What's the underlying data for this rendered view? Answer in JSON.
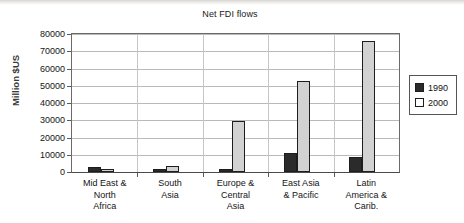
{
  "chart_data": {
    "type": "bar",
    "title": "Net FDI flows",
    "xlabel": "",
    "ylabel": "Million $US",
    "ylim": [
      0,
      80000
    ],
    "ytick_step": 10000,
    "yticks": [
      "0",
      "10000",
      "20000",
      "30000",
      "40000",
      "50000",
      "60000",
      "70000",
      "80000"
    ],
    "grid": true,
    "legend_position": "right",
    "categories": [
      "Mid East & North Africa",
      "South Asia",
      "Europe & Central Asia",
      "East Asia & Pacific",
      "Latin America & Carib."
    ],
    "category_label_lines": [
      [
        "Mid East &",
        "North",
        "Africa"
      ],
      [
        "South",
        "Asia"
      ],
      [
        "Europe &",
        "Central",
        "Asia"
      ],
      [
        "East Asia",
        "& Pacific"
      ],
      [
        "Latin",
        "America &",
        "Carib."
      ]
    ],
    "series": [
      {
        "name": "1990",
        "color": "#2b2b2b",
        "values": [
          2700,
          400,
          1200,
          11000,
          8700
        ]
      },
      {
        "name": "2000",
        "color": "#d2d2d2",
        "values": [
          1100,
          3200,
          29500,
          52800,
          76200
        ]
      }
    ]
  },
  "legend": {
    "items": [
      {
        "label": "1990"
      },
      {
        "label": "2000"
      }
    ]
  }
}
